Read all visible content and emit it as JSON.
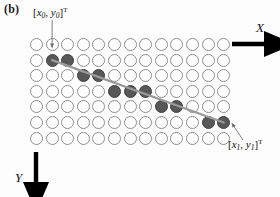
{
  "figure": {
    "panel_label": "(b)"
  },
  "axes": {
    "x": {
      "label": "X",
      "direction": "right",
      "arrow_color": "#000000"
    },
    "y": {
      "label": "Y",
      "direction": "down",
      "arrow_color": "#000000"
    }
  },
  "annotations": {
    "start": {
      "name": "start-point-label",
      "vector": "x0,y0",
      "var_x": "x",
      "sub_x": "0",
      "var_y": "y",
      "sub_y": "0",
      "transpose": "T",
      "full_text": "[x0, y0]T"
    },
    "end": {
      "name": "end-point-label",
      "vector": "x1,y1",
      "var_x": "x",
      "sub_x": "1",
      "var_y": "y",
      "sub_y": "1",
      "transpose": "T",
      "full_text": "[x1, y1]T"
    }
  },
  "colors": {
    "empty_circle_stroke": "#8d8d8d",
    "empty_circle_fill": "#ffffff",
    "filled_circle_fill": "#575757",
    "filled_circle_stroke": "#3f3f3f",
    "line": "#9a9a9a",
    "axis": "#000000",
    "leader": "#6e6e6e"
  },
  "grid": {
    "rows": 7,
    "cols": 13,
    "cell_diameter": 13,
    "spacing_x": 15.6,
    "spacing_y": 15.6,
    "origin_x": 30,
    "origin_y": 38,
    "filled_cells": [
      {
        "row": 1,
        "col": 1
      },
      {
        "row": 1,
        "col": 2
      },
      {
        "row": 2,
        "col": 3
      },
      {
        "row": 2,
        "col": 4
      },
      {
        "row": 3,
        "col": 5
      },
      {
        "row": 3,
        "col": 6
      },
      {
        "row": 3,
        "col": 7
      },
      {
        "row": 4,
        "col": 8
      },
      {
        "row": 4,
        "col": 9
      },
      {
        "row": 5,
        "col": 11
      },
      {
        "row": 5,
        "col": 12
      }
    ]
  },
  "line_segment": {
    "start_cell": {
      "row": 1,
      "col": 1
    },
    "end_cell": {
      "row": 5,
      "col": 12
    },
    "width": 2.2
  }
}
